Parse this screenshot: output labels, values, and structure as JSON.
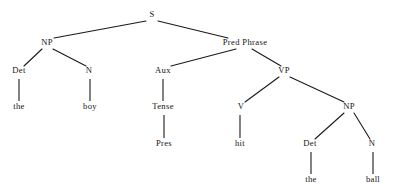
{
  "diagram": {
    "sentence": "the boy Pres hit the ball",
    "background_color": "#ffffff",
    "line_color": "#1a1a1a",
    "text_color": "#141414"
  },
  "nodes": {
    "s": {
      "label": "S",
      "x": 152,
      "y": 17
    },
    "np_subject": {
      "label": "NP",
      "x": 47,
      "y": 45
    },
    "pred_phrase": {
      "label": "Pred Phrase",
      "x": 245,
      "y": 45
    },
    "det_subject": {
      "label": "Det",
      "x": 19,
      "y": 73
    },
    "n_subject": {
      "label": "N",
      "x": 89,
      "y": 73
    },
    "aux": {
      "label": "Aux",
      "x": 163,
      "y": 73
    },
    "vp": {
      "label": "VP",
      "x": 284,
      "y": 73
    },
    "the_subject": {
      "label": "the",
      "x": 19,
      "y": 109
    },
    "boy": {
      "label": "boy",
      "x": 90,
      "y": 109
    },
    "tense": {
      "label": "Tense",
      "x": 163,
      "y": 109
    },
    "v": {
      "label": "V",
      "x": 241,
      "y": 109
    },
    "np_object": {
      "label": "NP",
      "x": 349,
      "y": 109
    },
    "pres": {
      "label": "Pres",
      "x": 164,
      "y": 146
    },
    "hit": {
      "label": "hit",
      "x": 240,
      "y": 146
    },
    "det_object": {
      "label": "Det",
      "x": 310,
      "y": 146
    },
    "n_object": {
      "label": "N",
      "x": 372,
      "y": 146
    },
    "the_object": {
      "label": "the",
      "x": 311,
      "y": 182
    },
    "ball": {
      "label": "ball",
      "x": 373,
      "y": 182
    }
  },
  "edges": [
    {
      "name": "s-to-np-subject",
      "x1": 146,
      "y1": 21,
      "x2": 54,
      "y2": 38
    },
    {
      "name": "s-to-pred-phrase",
      "x1": 158,
      "y1": 21,
      "x2": 228,
      "y2": 38
    },
    {
      "name": "np-subject-to-det",
      "x1": 42,
      "y1": 49,
      "x2": 24,
      "y2": 66
    },
    {
      "name": "np-subject-to-n",
      "x1": 53,
      "y1": 49,
      "x2": 86,
      "y2": 66
    },
    {
      "name": "pred-to-aux",
      "x1": 236,
      "y1": 49,
      "x2": 171,
      "y2": 66
    },
    {
      "name": "pred-to-vp",
      "x1": 252,
      "y1": 49,
      "x2": 281,
      "y2": 66
    },
    {
      "name": "vp-to-v",
      "x1": 279,
      "y1": 77,
      "x2": 245,
      "y2": 102
    },
    {
      "name": "vp-to-np-object",
      "x1": 290,
      "y1": 77,
      "x2": 344,
      "y2": 102
    },
    {
      "name": "np-object-to-det",
      "x1": 344,
      "y1": 113,
      "x2": 315,
      "y2": 139
    },
    {
      "name": "np-object-to-n",
      "x1": 354,
      "y1": 113,
      "x2": 370,
      "y2": 139
    }
  ],
  "stems": [
    {
      "name": "det-subject-to-the",
      "x": 19,
      "y1": 79,
      "y2": 101
    },
    {
      "name": "n-subject-to-boy",
      "x": 90,
      "y1": 79,
      "y2": 101
    },
    {
      "name": "aux-to-tense",
      "x": 163,
      "y1": 79,
      "y2": 101
    },
    {
      "name": "tense-to-pres",
      "x": 164,
      "y1": 115,
      "y2": 138
    },
    {
      "name": "v-to-hit",
      "x": 240,
      "y1": 115,
      "y2": 138
    },
    {
      "name": "det-object-to-the",
      "x": 311,
      "y1": 152,
      "y2": 174
    },
    {
      "name": "n-object-to-ball",
      "x": 373,
      "y1": 152,
      "y2": 174
    }
  ]
}
